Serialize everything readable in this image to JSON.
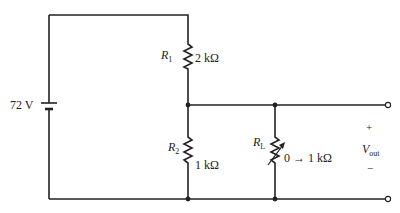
{
  "diagram": {
    "type": "voltage-divider circuit",
    "source": {
      "label": "72 V"
    },
    "resistors": [
      {
        "id": "R1",
        "symbol": "R",
        "subscript": "1",
        "value": "2 kΩ"
      },
      {
        "id": "R2",
        "symbol": "R",
        "subscript": "2",
        "value": "1 kΩ"
      },
      {
        "id": "RL",
        "symbol": "R",
        "subscript": "L",
        "value": "0 → 1 kΩ",
        "variable": true
      }
    ],
    "output": {
      "plus": "+",
      "minus": "−",
      "symbol": "V",
      "subscript": "out"
    },
    "colors": {
      "wire": "#222222",
      "background": "#ffffff"
    }
  }
}
